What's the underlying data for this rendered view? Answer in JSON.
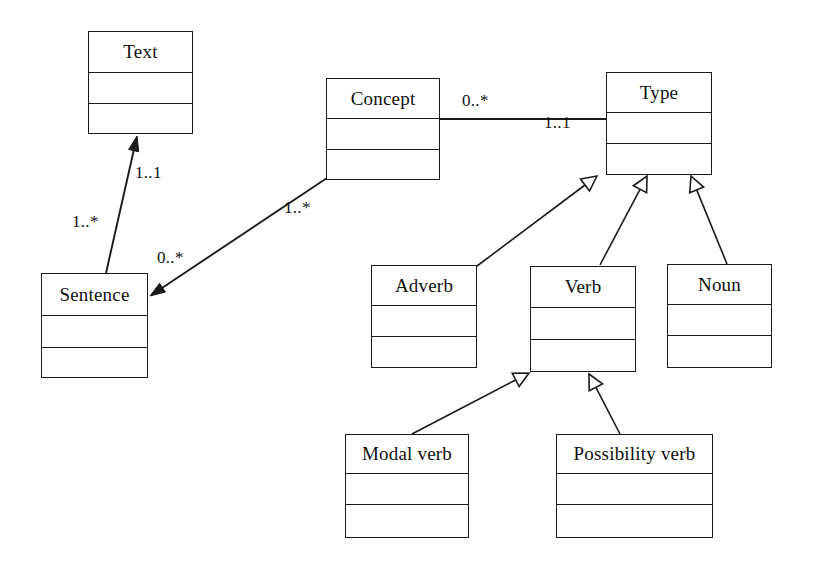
{
  "diagram": {
    "type": "uml-class-diagram",
    "canvas": {
      "width": 814,
      "height": 571
    },
    "stroke_color": "#1a1a1a",
    "fill_color": "#ffffff",
    "text_color": "#101010",
    "classes": [
      {
        "id": "text",
        "name": "Text",
        "x": 88,
        "y": 31,
        "width": 105,
        "height": 103,
        "name_h": 41,
        "attr_h": 31,
        "name_font_size": 19
      },
      {
        "id": "sentence",
        "name": "Sentence",
        "x": 41,
        "y": 273,
        "width": 107,
        "height": 105,
        "name_h": 42,
        "attr_h": 32,
        "name_font_size": 19
      },
      {
        "id": "concept",
        "name": "Concept",
        "x": 326,
        "y": 78,
        "width": 114,
        "height": 102,
        "name_h": 40,
        "attr_h": 31,
        "name_font_size": 19
      },
      {
        "id": "type",
        "name": "Type",
        "x": 606,
        "y": 72,
        "width": 106,
        "height": 103,
        "name_h": 40,
        "attr_h": 31,
        "name_font_size": 19
      },
      {
        "id": "adverb",
        "name": "Adverb",
        "x": 371,
        "y": 265,
        "width": 106,
        "height": 103,
        "name_h": 40,
        "attr_h": 31,
        "name_font_size": 19
      },
      {
        "id": "verb",
        "name": "Verb",
        "x": 530,
        "y": 266,
        "width": 106,
        "height": 106,
        "name_h": 41,
        "attr_h": 32,
        "name_font_size": 19
      },
      {
        "id": "noun",
        "name": "Noun",
        "x": 667,
        "y": 264,
        "width": 105,
        "height": 104,
        "name_h": 40,
        "attr_h": 31,
        "name_font_size": 19
      },
      {
        "id": "modal-verb",
        "name": "Modal verb",
        "x": 345,
        "y": 434,
        "width": 124,
        "height": 104,
        "name_h": 39,
        "attr_h": 31,
        "name_font_size": 19
      },
      {
        "id": "possibility-verb",
        "name": "Possibility verb",
        "x": 556,
        "y": 434,
        "width": 157,
        "height": 104,
        "name_h": 39,
        "attr_h": 31,
        "name_font_size": 19
      }
    ],
    "associations": [
      {
        "id": "sentence-to-text",
        "from": "sentence",
        "to": "text",
        "arrow": "filled",
        "x1": 106,
        "y1": 273,
        "x2": 137,
        "y2": 136,
        "labels": [
          {
            "text": "1..1",
            "x": 135,
            "y": 163
          },
          {
            "text": "1..*",
            "x": 72,
            "y": 212
          }
        ]
      },
      {
        "id": "concept-to-sentence",
        "from": "concept",
        "to": "sentence",
        "arrow": "filled",
        "x1": 327,
        "y1": 178,
        "x2": 150,
        "y2": 296,
        "labels": [
          {
            "text": "1..*",
            "x": 284,
            "y": 198
          },
          {
            "text": "0..*",
            "x": 157,
            "y": 248
          }
        ]
      },
      {
        "id": "concept-to-type",
        "from": "concept",
        "to": "type",
        "arrow": "none",
        "x1": 440,
        "y1": 119,
        "x2": 606,
        "y2": 119,
        "labels": [
          {
            "text": "0..*",
            "x": 462,
            "y": 91
          },
          {
            "text": "1..1",
            "x": 544,
            "y": 113
          }
        ]
      }
    ],
    "generalizations": [
      {
        "id": "adverb-to-type",
        "from": "adverb",
        "to": "type",
        "x1": 477,
        "y1": 266,
        "x2": 597,
        "y2": 176
      },
      {
        "id": "verb-to-type",
        "from": "verb",
        "to": "type",
        "x1": 600,
        "y1": 265,
        "x2": 647,
        "y2": 176
      },
      {
        "id": "noun-to-type",
        "from": "noun",
        "to": "type",
        "x1": 727,
        "y1": 264,
        "x2": 691,
        "y2": 176
      },
      {
        "id": "modal-verb-to-verb",
        "from": "modal-verb",
        "to": "verb",
        "x1": 412,
        "y1": 434,
        "x2": 529,
        "y2": 373
      },
      {
        "id": "possibility-verb-to-verb",
        "from": "possibility-verb",
        "to": "verb",
        "x1": 620,
        "y1": 434,
        "x2": 589,
        "y2": 374
      }
    ],
    "label_font_size": 17
  }
}
